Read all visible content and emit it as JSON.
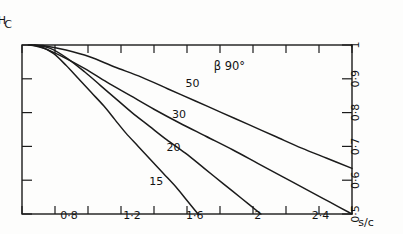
{
  "chart_data": {
    "type": "line",
    "title": "",
    "orientation_note": "figure scanned upside-down (rotated 180 degrees)",
    "xlabel": "s/c",
    "ylabel": "C_H",
    "xlim": [
      0.5,
      2.6
    ],
    "ylim": [
      0.5,
      1.0
    ],
    "x_axis_position": "top",
    "y_axis_position": "right",
    "x_ticks": [
      0.6,
      0.8,
      1.0,
      1.2,
      1.4,
      1.6,
      1.8,
      2.0,
      2.2,
      2.4,
      2.6
    ],
    "x_tick_labels": [
      "",
      "0·8",
      "",
      "1·2",
      "",
      "1·6",
      "",
      "2",
      "",
      "2·4",
      ""
    ],
    "y_ticks": [
      0.5,
      0.6,
      0.7,
      0.8,
      0.9,
      1.0
    ],
    "y_tick_labels": [
      "0·5",
      "0·6",
      "0·7",
      "0·8",
      "0·9",
      "1"
    ],
    "grid": false,
    "legend": "inline-curve-labels",
    "annotation": "β 90°",
    "series": [
      {
        "name": "15",
        "label": "15",
        "points": [
          [
            1.62,
            0.5
          ],
          [
            1.55,
            0.54
          ],
          [
            1.48,
            0.58
          ],
          [
            1.4,
            0.62
          ],
          [
            1.32,
            0.66
          ],
          [
            1.24,
            0.7
          ],
          [
            1.16,
            0.74
          ],
          [
            1.09,
            0.78
          ],
          [
            1.02,
            0.82
          ],
          [
            0.94,
            0.86
          ],
          [
            0.86,
            0.9
          ],
          [
            0.78,
            0.94
          ],
          [
            0.7,
            0.975
          ],
          [
            0.62,
            0.995
          ],
          [
            0.54,
            1.0
          ]
        ]
      },
      {
        "name": "20",
        "label": "20",
        "points": [
          [
            2.02,
            0.5
          ],
          [
            1.9,
            0.545
          ],
          [
            1.78,
            0.59
          ],
          [
            1.66,
            0.635
          ],
          [
            1.54,
            0.68
          ],
          [
            1.42,
            0.72
          ],
          [
            1.31,
            0.76
          ],
          [
            1.2,
            0.8
          ],
          [
            1.1,
            0.84
          ],
          [
            1.0,
            0.88
          ],
          [
            0.9,
            0.92
          ],
          [
            0.79,
            0.96
          ],
          [
            0.68,
            0.99
          ],
          [
            0.58,
            1.0
          ]
        ]
      },
      {
        "name": "30",
        "label": "30",
        "points": [
          [
            2.6,
            0.5
          ],
          [
            2.46,
            0.535
          ],
          [
            2.32,
            0.57
          ],
          [
            2.16,
            0.61
          ],
          [
            2.0,
            0.65
          ],
          [
            1.84,
            0.69
          ],
          [
            1.67,
            0.73
          ],
          [
            1.5,
            0.77
          ],
          [
            1.34,
            0.81
          ],
          [
            1.19,
            0.85
          ],
          [
            1.04,
            0.89
          ],
          [
            0.9,
            0.93
          ],
          [
            0.76,
            0.965
          ],
          [
            0.64,
            0.99
          ],
          [
            0.56,
            1.0
          ]
        ]
      },
      {
        "name": "50",
        "label": "50",
        "points": [
          [
            2.6,
            0.635
          ],
          [
            2.44,
            0.665
          ],
          [
            2.28,
            0.695
          ],
          [
            2.11,
            0.73
          ],
          [
            1.94,
            0.765
          ],
          [
            1.77,
            0.8
          ],
          [
            1.6,
            0.835
          ],
          [
            1.43,
            0.87
          ],
          [
            1.26,
            0.905
          ],
          [
            1.09,
            0.935
          ],
          [
            0.93,
            0.965
          ],
          [
            0.78,
            0.985
          ],
          [
            0.65,
            0.997
          ],
          [
            0.55,
            1.0
          ]
        ]
      }
    ],
    "series_label_positions": [
      {
        "name": "15",
        "x": 1.355,
        "y": 0.585
      },
      {
        "name": "20",
        "x": 1.465,
        "y": 0.685
      },
      {
        "name": "30",
        "x": 1.5,
        "y": 0.785
      },
      {
        "name": "50",
        "x": 1.585,
        "y": 0.875
      }
    ],
    "annotation_position": {
      "x": 1.82,
      "y": 0.925
    }
  },
  "axes": {
    "x_title": "s/c",
    "y_title": "C",
    "y_title_sub": "H"
  }
}
